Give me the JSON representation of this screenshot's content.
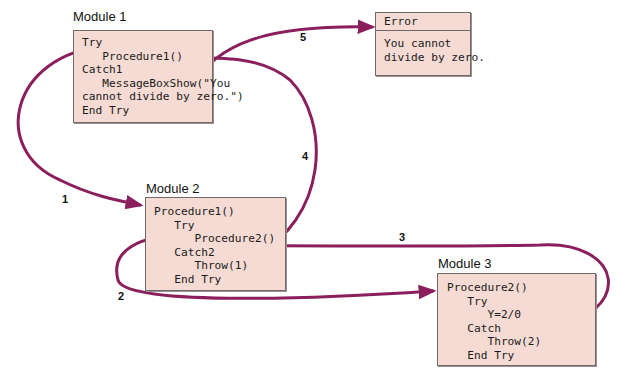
{
  "modules": [
    {
      "id": "module1",
      "title": "Module 1",
      "lines": [
        "Try",
        "   Procedure1()",
        "Catch1",
        "   MessageBoxShow(\"You",
        "cannot divide by zero.\")",
        "End Try"
      ]
    },
    {
      "id": "module2",
      "title": "Module 2",
      "lines": [
        "Procedure1()",
        "   Try",
        "      Procedure2()",
        "   Catch2",
        "      Throw(1)",
        "   End Try"
      ]
    },
    {
      "id": "module3",
      "title": "Module 3",
      "lines": [
        "Procedure2()",
        "   Try",
        "      Y=2/0",
        "   Catch",
        "      Throw(2)",
        "   End Try"
      ]
    }
  ],
  "error_dialog": {
    "title": "Error",
    "message_lines": [
      "You cannot",
      "divide by zero."
    ]
  },
  "steps": [
    {
      "number": "1",
      "description": "Module 1 calls Procedure1 in Module 2"
    },
    {
      "number": "2",
      "description": "Procedure1 calls Procedure2 in Module 3"
    },
    {
      "number": "3",
      "description": "Throw(2) returns to Catch2 in Module 2"
    },
    {
      "number": "4",
      "description": "Throw(1) returns to Catch1 in Module 1"
    },
    {
      "number": "5",
      "description": "MessageBoxShow displays Error dialog"
    }
  ],
  "colors": {
    "arrow": "#8b1f5c",
    "box_fill": "#f5dbd3",
    "box_border": "#6e6a6a"
  }
}
